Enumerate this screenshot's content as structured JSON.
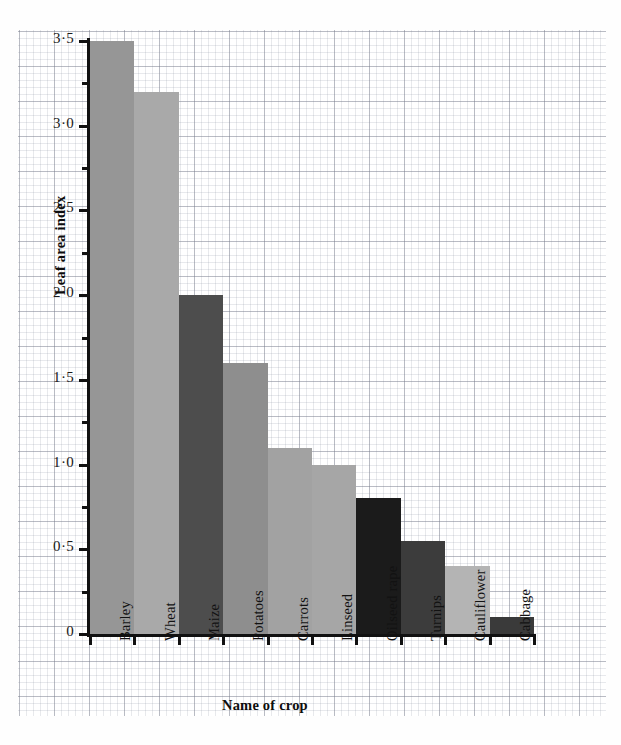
{
  "chart_data": {
    "type": "bar",
    "title": "",
    "xlabel": "Name of crop",
    "ylabel": "Leaf area index",
    "categories": [
      "Barley",
      "Wheat",
      "Maize",
      "Potatoes",
      "Carrots",
      "Linseed",
      "Oilseed rape",
      "Turnips",
      "Cauliflower",
      "Cabbage"
    ],
    "values": [
      3.5,
      3.2,
      2.0,
      1.6,
      1.1,
      1.0,
      0.8,
      0.55,
      0.4,
      0.1
    ],
    "bar_colors": [
      "#969696",
      "#a9a9a9",
      "#4d4d4d",
      "#8e8e8e",
      "#a2a2a2",
      "#a6a6a6",
      "#1b1b1b",
      "#3c3c3c",
      "#b4b4b4",
      "#3a3a3a"
    ],
    "ylim": [
      0,
      3.5
    ],
    "y_major_ticks": [
      0,
      0.5,
      1.0,
      1.5,
      2.0,
      2.5,
      3.0,
      3.5
    ],
    "y_minor_ticks": [
      0.25,
      0.75,
      1.25,
      1.75,
      2.25,
      2.75,
      3.25
    ],
    "y_tick_labels": [
      "0",
      "0·5",
      "1·0",
      "1·5",
      "2·0",
      "2·5",
      "3·0",
      "3·5"
    ],
    "grid": true,
    "grid_style": "graph-paper",
    "legend": "none",
    "axis_color": "#111111",
    "background": "#ffffff"
  }
}
